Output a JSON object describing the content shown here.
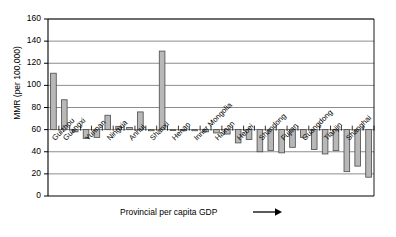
{
  "chart_data": {
    "type": "bar",
    "title": "",
    "subtitle": "",
    "xlabel": "Provincial per capita GDP",
    "xlabel_arrow": "→",
    "ylabel": "MMR (per 100,000)",
    "ylim": [
      0,
      160
    ],
    "yticks": [
      0,
      20,
      40,
      60,
      80,
      100,
      120,
      140,
      160
    ],
    "ytick_labels": [
      "0",
      "20",
      "40",
      "60",
      "80",
      "100",
      "120",
      "140",
      "160"
    ],
    "baseline": 60,
    "grid": "horizontal",
    "legend": "none",
    "bar_fill": "#b8b8b8",
    "bar_edge": "#4a4a4a",
    "axis_color": "#000000",
    "grid_color": "#808080",
    "categories": [
      "Guizhou",
      "Guangxi",
      "",
      "Yunnan",
      "",
      "Ningxia",
      "",
      "Anhui",
      "",
      "Shanxi",
      "",
      "Henan",
      "",
      "Inner Mongolia",
      "",
      "Hainan",
      "",
      "Hebei",
      "",
      "Shandong",
      "",
      "Fujian",
      "",
      "Guangdong",
      "",
      "Tianjin",
      "",
      "Shanghai",
      "",
      ""
    ],
    "labeled_categories": [
      "Guizhou",
      "Guangxi",
      "Yunnan",
      "Ningxia",
      "Anhui",
      "Shanxi",
      "Henan",
      "Inner Mongolia",
      "Hainan",
      "Hebei",
      "Shandong",
      "Fujian",
      "Guangdong",
      "Tianjin",
      "Shanghai"
    ],
    "values": [
      111,
      87,
      58,
      52,
      53,
      73,
      63,
      62,
      76,
      59,
      131,
      60,
      59,
      59,
      58,
      57,
      56,
      48,
      51,
      40,
      41,
      39,
      44,
      53,
      42,
      38,
      41,
      22,
      27,
      17
    ],
    "n_bars": 30,
    "value_max": 131,
    "value_min": 17
  }
}
